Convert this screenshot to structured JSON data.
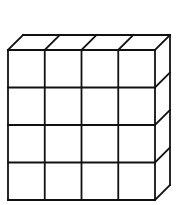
{
  "diagram": {
    "type": "cube-grid-oblique",
    "columns": 4,
    "rows": 4,
    "depth": 1,
    "total_cubes": 16,
    "front_face": {
      "x0": 8,
      "y0": 50,
      "x1": 155,
      "y1": 200
    },
    "depth_offset": {
      "dx": 15,
      "dy": -15
    },
    "stroke_color": "#111111",
    "fill_color": "#ffffff",
    "stroke_width": 1.8
  }
}
